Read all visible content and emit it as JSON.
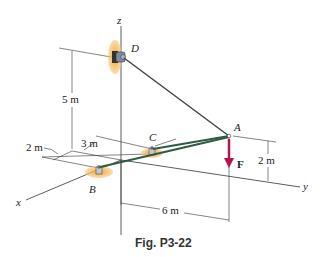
{
  "figure": {
    "caption": "Fig. P3-22",
    "axes": {
      "x": "x",
      "y": "y",
      "z": "z"
    },
    "points": {
      "A": "A",
      "B": "B",
      "C": "C",
      "D": "D"
    },
    "force": {
      "label": "F",
      "color": "#b0174a"
    },
    "dimensions": {
      "z_height_D": "5 m",
      "x_offset_C": "3 m",
      "x_offset_B": "2 m",
      "y_distance_A": "6 m",
      "z_height_A": "2 m"
    },
    "colors": {
      "cable": "#3a4a3a",
      "strut": "#2f5a44",
      "support_patch": "#f0a030",
      "axis_line": "#333333"
    }
  }
}
